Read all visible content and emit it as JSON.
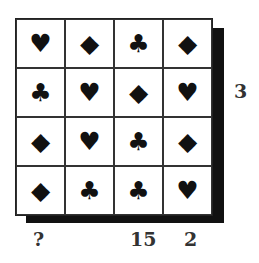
{
  "grid": {
    "rows": [
      [
        "heart",
        "diamond",
        "club",
        "diamond"
      ],
      [
        "club",
        "heart",
        "diamond",
        "heart"
      ],
      [
        "diamond",
        "heart",
        "club",
        "diamond"
      ],
      [
        "diamond",
        "club",
        "club",
        "heart"
      ]
    ],
    "glyphs": {
      "heart": "♥",
      "diamond": "◆",
      "club": "♣"
    }
  },
  "labels": {
    "row_2": "3",
    "col_1": "?",
    "col_3": "15",
    "col_4": "2"
  }
}
